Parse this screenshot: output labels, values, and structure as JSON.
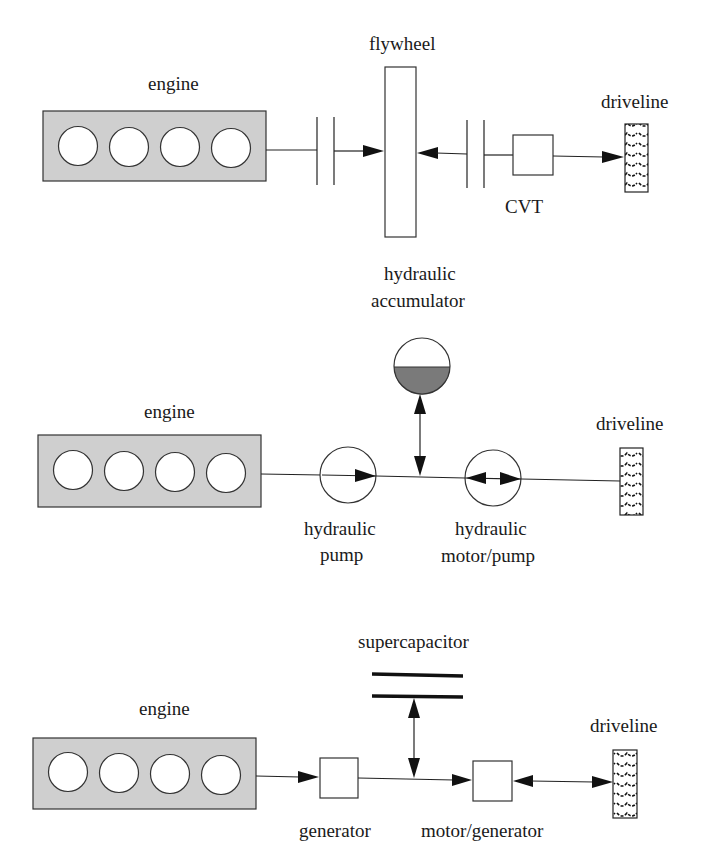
{
  "diagram": {
    "panels": [
      {
        "name": "flywheel-system",
        "labels": {
          "engine": "engine",
          "storage": "flywheel",
          "transmission": "CVT",
          "driveline": "driveline"
        }
      },
      {
        "name": "hydraulic-system",
        "labels": {
          "engine": "engine",
          "storage_line1": "hydraulic",
          "storage_line2": "accumulator",
          "pump_line1": "hydraulic",
          "pump_line2": "pump",
          "motor_line1": "hydraulic",
          "motor_line2": "motor/pump",
          "driveline": "driveline"
        }
      },
      {
        "name": "electric-system",
        "labels": {
          "engine": "engine",
          "storage": "supercapacitor",
          "generator": "generator",
          "motor": "motor/generator",
          "driveline": "driveline"
        }
      }
    ],
    "colors": {
      "engine_fill": "#cfcfcf",
      "accumulator_fluid": "#7a7a7a",
      "line": "#222222"
    }
  }
}
